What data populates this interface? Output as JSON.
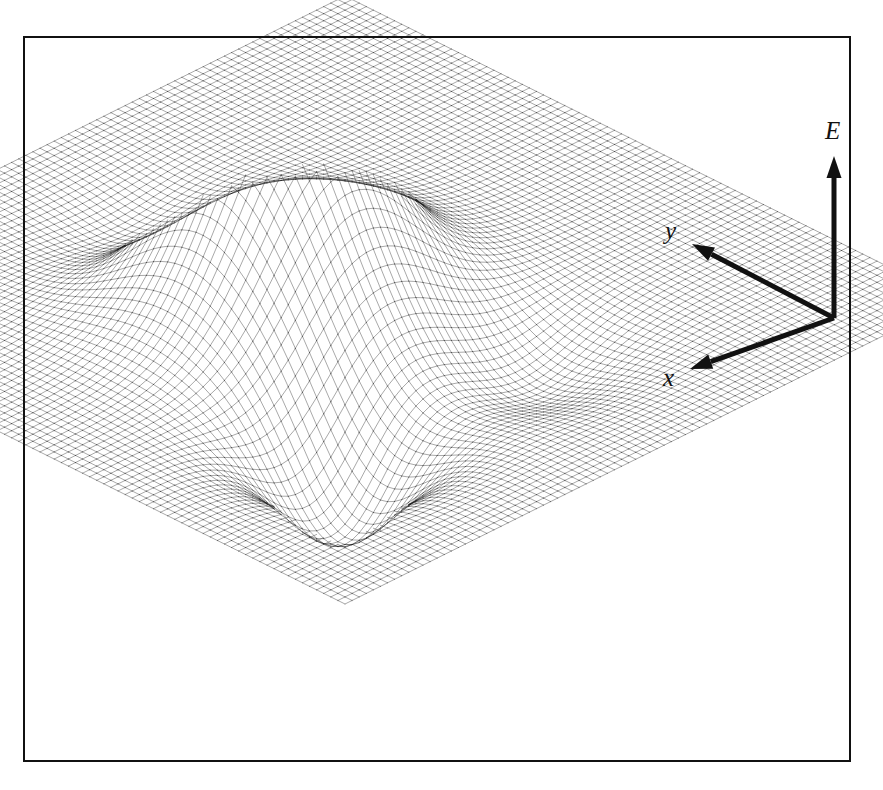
{
  "figure": {
    "kind": "3d-wireframe-surface-plot",
    "background_color": "#ffffff",
    "ink_color": "#111111",
    "frame": {
      "name": "figure-border",
      "x": 23,
      "y": 36,
      "width": 828,
      "height": 726,
      "stroke_width": 2.5,
      "color": "#111111"
    }
  },
  "axes": {
    "origin": {
      "x": 834,
      "y": 318
    },
    "E": {
      "label": "E",
      "tip": {
        "x": 834,
        "y": 156
      },
      "label_pos": {
        "x": 825,
        "y": 118
      }
    },
    "y": {
      "label": "y",
      "tip": {
        "x": 692,
        "y": 244
      },
      "label_pos": {
        "x": 665,
        "y": 218
      }
    },
    "x": {
      "label": "x",
      "tip": {
        "x": 690,
        "y": 369
      },
      "label_pos": {
        "x": 663,
        "y": 365
      }
    },
    "arrow_stroke_width": 5,
    "arrow_head_length": 22,
    "arrow_head_width": 15
  },
  "chart_data": {
    "type": "surface",
    "title": "",
    "xlabel": "x",
    "ylabel": "y",
    "zlabel": "E",
    "grid": false,
    "legend": null,
    "mesh": {
      "nu": 86,
      "nv": 86,
      "u_range": [
        -1,
        1
      ],
      "v_range": [
        -1,
        1
      ],
      "line_color": "#1a1a1a",
      "line_width": 0.38,
      "hidden_line_removal": true
    },
    "projection": {
      "type": "oblique-isometric",
      "center": {
        "x": 345,
        "y": 300
      },
      "u_vector": {
        "x": 305,
        "y": 152
      },
      "v_vector": {
        "x": -305,
        "y": 152
      },
      "z_scale": -232
    },
    "surface_terms": [
      {
        "name": "main-peak",
        "amplitude": 1.0,
        "cx": -0.1,
        "cy": 0.1,
        "sx": 0.22,
        "sy": 0.22
      },
      {
        "name": "front-well",
        "amplitude": -0.46,
        "cx": 0.44,
        "cy": 0.46,
        "sx": 0.15,
        "sy": 0.15
      },
      {
        "name": "right-dip",
        "amplitude": -0.17,
        "cx": 0.46,
        "cy": -0.12,
        "sx": 0.17,
        "sy": 0.17
      },
      {
        "name": "back-left-dip",
        "amplitude": -0.15,
        "cx": -0.48,
        "cy": 0.1,
        "sx": 0.17,
        "sy": 0.17
      }
    ],
    "z_range": [
      -0.46,
      1.0
    ],
    "baseline_z": 0
  }
}
